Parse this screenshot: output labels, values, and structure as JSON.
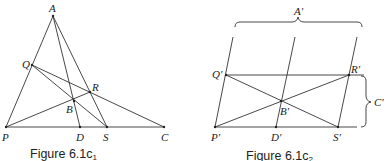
{
  "figures": [
    {
      "caption_main": "Figure 6.1c",
      "caption_sub": "1",
      "points": {
        "A": {
          "label": "A",
          "x": 53,
          "y": 16
        },
        "Q": {
          "label": "Q",
          "x": 32,
          "y": 65
        },
        "R": {
          "label": "R",
          "x": 90,
          "y": 92
        },
        "B": {
          "label": "B",
          "x": 74,
          "y": 101
        },
        "P": {
          "label": "P",
          "x": 6,
          "y": 127
        },
        "D": {
          "label": "D",
          "x": 80,
          "y": 127
        },
        "S": {
          "label": "S",
          "x": 107,
          "y": 127
        },
        "C": {
          "label": "C",
          "x": 164,
          "y": 127
        }
      }
    },
    {
      "caption_main": "Figure 6.1c",
      "caption_sub": "2",
      "points": {
        "P": {
          "label": "P′",
          "x": 215,
          "y": 127
        },
        "Q": {
          "label": "Q′",
          "x": 226,
          "y": 75
        },
        "R": {
          "label": "R′",
          "x": 349,
          "y": 75
        },
        "B": {
          "label": "B′",
          "x": 281,
          "y": 101
        },
        "D": {
          "label": "D′",
          "x": 276,
          "y": 127
        },
        "S": {
          "label": "S′",
          "x": 338,
          "y": 127
        }
      },
      "brace_labels": {
        "A": "A′",
        "C": "C′"
      }
    }
  ]
}
